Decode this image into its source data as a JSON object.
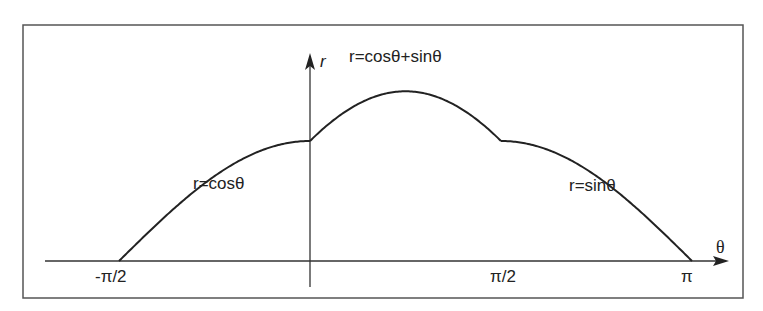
{
  "figure": {
    "stroke_color": "#2a2a2a",
    "frame_color": "#555555",
    "axes": {
      "x_label": "θ",
      "y_label": "r",
      "x_ticks": [
        {
          "label": "-π/2",
          "value": "-pi/2"
        },
        {
          "label": "π/2",
          "value": "pi/2"
        },
        {
          "label": "π",
          "value": "pi"
        }
      ]
    },
    "curves": [
      {
        "label": "r=cosθ",
        "domain": "[-π/2, 0]"
      },
      {
        "label": "r=cosθ+sinθ",
        "domain": "[0, π/2]"
      },
      {
        "label": "r=sinθ",
        "domain": "[π/2, π]"
      }
    ]
  },
  "chart_data": {
    "type": "line",
    "title": "",
    "xlabel": "θ",
    "ylabel": "r",
    "x_tick_labels": [
      "-π/2",
      "π/2",
      "π"
    ],
    "grid": false,
    "series": [
      {
        "name": "r=cosθ",
        "x_range": [
          -1.5708,
          0
        ],
        "formula": "cos(θ)"
      },
      {
        "name": "r=cosθ+sinθ",
        "x_range": [
          0,
          1.5708
        ],
        "formula": "cos(θ)+sin(θ)"
      },
      {
        "name": "r=sinθ",
        "x_range": [
          1.5708,
          3.1416
        ],
        "formula": "sin(θ)"
      }
    ],
    "xlim": [
      -1.5708,
      3.1416
    ],
    "ylim": [
      0,
      1.4142
    ]
  }
}
